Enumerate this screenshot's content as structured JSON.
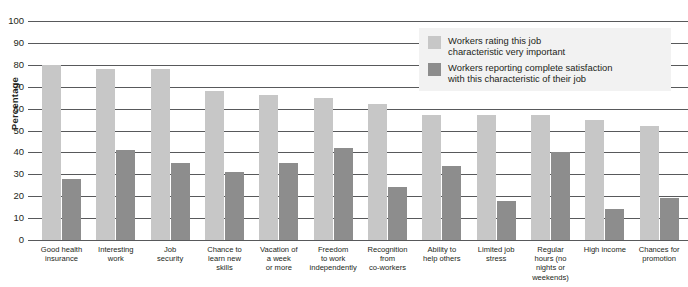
{
  "chart_data": {
    "type": "bar",
    "title": "",
    "xlabel": "",
    "ylabel": "Percentage",
    "ylim": [
      0,
      100
    ],
    "ytick_step": 10,
    "yticks": [
      "100",
      "90",
      "80",
      "70",
      "60",
      "50",
      "40",
      "30",
      "20",
      "10",
      "0"
    ],
    "grid": true,
    "legend_position": "top-right",
    "categories": [
      "Good health insurance",
      "Interesting work",
      "Job security",
      "Chance to learn new skills",
      "Vacation of a week or more",
      "Freedom to work independently",
      "Recognition from co-workers",
      "Ability to help others",
      "Limited job stress",
      "Regular hours (no nights or weekends)",
      "High income",
      "Chances for promotion"
    ],
    "category_lines": [
      [
        "Good health",
        "insurance"
      ],
      [
        "Interesting",
        "work"
      ],
      [
        "Job",
        "security"
      ],
      [
        "Chance to",
        "learn new",
        "skills"
      ],
      [
        "Vacation of",
        "a week",
        "or more"
      ],
      [
        "Freedom",
        "to work",
        "independently"
      ],
      [
        "Recognition",
        "from",
        "co-workers"
      ],
      [
        "Ability to",
        "help others"
      ],
      [
        "Limited job",
        "stress"
      ],
      [
        "Regular",
        "hours (no",
        "nights or",
        "weekends)"
      ],
      [
        "High income"
      ],
      [
        "Chances for",
        "promotion"
      ]
    ],
    "series": [
      {
        "name": "Workers rating this job characteristic very important",
        "color": "#c7c7c7",
        "values": [
          80,
          78,
          78,
          68,
          66,
          65,
          62,
          57,
          57,
          57,
          55,
          52
        ]
      },
      {
        "name": "Workers reporting complete satisfaction with this characteristic of their job",
        "color": "#8d8d8d",
        "values": [
          28,
          41,
          35,
          31,
          35,
          42,
          24,
          34,
          18,
          40,
          14,
          19
        ]
      }
    ]
  },
  "legend": {
    "items": [
      {
        "swatch": "light",
        "line1": "Workers rating this job",
        "line2": "characteristic very important"
      },
      {
        "swatch": "dark",
        "line1": "Workers reporting complete satisfaction",
        "line2": "with this characteristic of their job"
      }
    ]
  }
}
